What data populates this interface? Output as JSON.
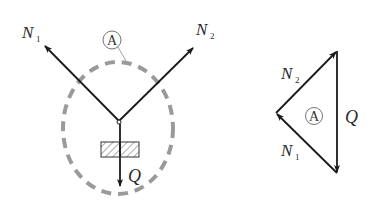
{
  "colors": {
    "stroke": "#1a1a1a",
    "dashed_boundary": "#9a9a9a",
    "background": "#ffffff"
  },
  "left_figure": {
    "region_label": "A",
    "forces": {
      "n1": {
        "symbol": "N",
        "subscript": "1"
      },
      "n2": {
        "symbol": "N",
        "subscript": "2"
      },
      "q": {
        "symbol": "Q"
      }
    }
  },
  "right_figure": {
    "region_label": "A",
    "forces": {
      "n1": {
        "symbol": "N",
        "subscript": "1"
      },
      "n2": {
        "symbol": "N",
        "subscript": "2"
      },
      "q": {
        "symbol": "Q"
      }
    }
  }
}
